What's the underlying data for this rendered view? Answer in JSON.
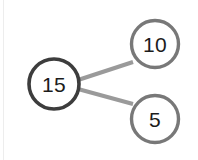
{
  "diagram": {
    "kind": "number-bond",
    "background_color": "#ffffff",
    "whole": {
      "label": "15",
      "cx": 54,
      "cy": 84,
      "r": 25,
      "stroke": "#3d3d3d",
      "stroke_width": 3.6,
      "fill": "#ffffff"
    },
    "parts": [
      {
        "label": "10",
        "cx": 155,
        "cy": 44,
        "r": 23.5,
        "stroke": "#787878",
        "stroke_width": 3.4,
        "fill": "#ffffff"
      },
      {
        "label": "5",
        "cx": 155,
        "cy": 119,
        "r": 23.5,
        "stroke": "#787878",
        "stroke_width": 3.4,
        "fill": "#ffffff"
      }
    ],
    "connectors": [
      {
        "name": "whole-to-part-10",
        "x1": 78,
        "y1": 80,
        "x2": 133,
        "y2": 62,
        "stroke": "#9a9a9a",
        "stroke_width": 4
      },
      {
        "name": "whole-to-part-5",
        "x1": 78,
        "y1": 89,
        "x2": 133,
        "y2": 104,
        "stroke": "#9a9a9a",
        "stroke_width": 4
      }
    ],
    "page_edge_rule_color": "#ededed"
  }
}
